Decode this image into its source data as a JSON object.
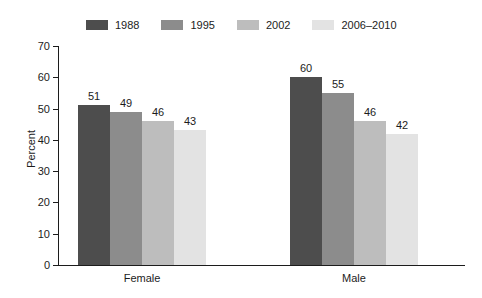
{
  "chart_data": {
    "type": "bar",
    "title": "",
    "xlabel": "",
    "ylabel": "Percent",
    "ylim": [
      0,
      70
    ],
    "yticks": [
      0,
      10,
      20,
      30,
      40,
      50,
      60,
      70
    ],
    "grid": false,
    "legend_position": "top",
    "categories": [
      "Female",
      "Male"
    ],
    "series": [
      {
        "name": "1988",
        "color": "#4d4d4d",
        "values": [
          51,
          60
        ]
      },
      {
        "name": "1995",
        "color": "#8c8c8c",
        "values": [
          49,
          55
        ]
      },
      {
        "name": "2002",
        "color": "#bdbdbd",
        "values": [
          46,
          46
        ]
      },
      {
        "name": "2006–2010",
        "color": "#e3e3e3",
        "values": [
          43,
          42
        ]
      }
    ],
    "data_labels": [
      [
        "51",
        "49",
        "46",
        "43"
      ],
      [
        "60",
        "55",
        "46",
        "42"
      ]
    ]
  },
  "axis": {
    "y_tick_labels": [
      "0",
      "10",
      "20",
      "30",
      "40",
      "50",
      "60",
      "70"
    ]
  },
  "legend": {
    "items": [
      {
        "label": "1988"
      },
      {
        "label": "1995"
      },
      {
        "label": "2002"
      },
      {
        "label": "2006–2010"
      }
    ]
  }
}
